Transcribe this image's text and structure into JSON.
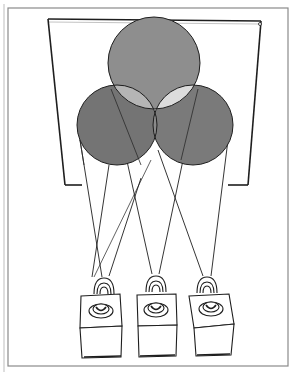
{
  "figure": {
    "colors": {
      "background": "#ffffff",
      "frame": "#8a8a8a",
      "ink": "#1e1e1e",
      "top_circle": "#8e8e8e",
      "left_circle": "#747474",
      "right_circle": "#7a7a7a",
      "overlap_top_left": "#b5b5b5",
      "overlap_top_right": "#dcdcdc",
      "overlap_left_right": "#8a8a8a",
      "center_overlap": "#ffffff"
    },
    "circles": [
      {
        "name": "top",
        "cx": 154,
        "cy": 63,
        "r": 46
      },
      {
        "name": "left",
        "cx": 117,
        "cy": 125,
        "r": 40
      },
      {
        "name": "right",
        "cx": 193,
        "cy": 125,
        "r": 40
      }
    ],
    "projectors": [
      {
        "name": "left",
        "x": 100
      },
      {
        "name": "center",
        "x": 156
      },
      {
        "name": "right",
        "x": 211
      }
    ]
  }
}
